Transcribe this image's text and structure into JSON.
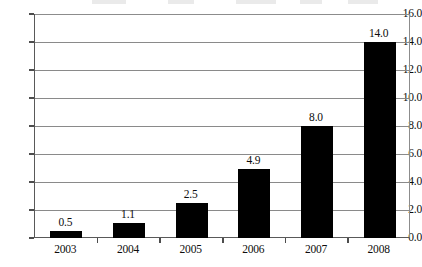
{
  "chart_data": {
    "type": "bar",
    "title": "",
    "subtitle": "",
    "xlabel": "",
    "ylabel": "",
    "categories": [
      "2003",
      "2004",
      "2005",
      "2006",
      "2007",
      "2008"
    ],
    "values": [
      0.5,
      1.1,
      2.5,
      4.9,
      8.0,
      14.0
    ],
    "value_labels": [
      "0.5",
      "1.1",
      "2.5",
      "4.9",
      "8.0",
      "14.0"
    ],
    "ylim": [
      0.0,
      16.0
    ],
    "ytick_step": 2.0,
    "ytick_labels": [
      "0.0",
      "2.0",
      "4.0",
      "6.0",
      "8.0",
      "10.0",
      "12.0",
      "14.0",
      "16.0"
    ],
    "ytick_values": [
      0.0,
      2.0,
      4.0,
      6.0,
      8.0,
      10.0,
      12.0,
      14.0,
      16.0
    ],
    "grid": "horizontal",
    "legend": "none",
    "series": [
      {
        "name": "",
        "values": [
          0.5,
          1.1,
          2.5,
          4.9,
          8.0,
          14.0
        ]
      }
    ],
    "colors": {
      "bar": "#000000",
      "background": "#ffffff",
      "gridline": "#8a8a8a",
      "axis": "#595959",
      "text": "#0d0d0d"
    }
  }
}
